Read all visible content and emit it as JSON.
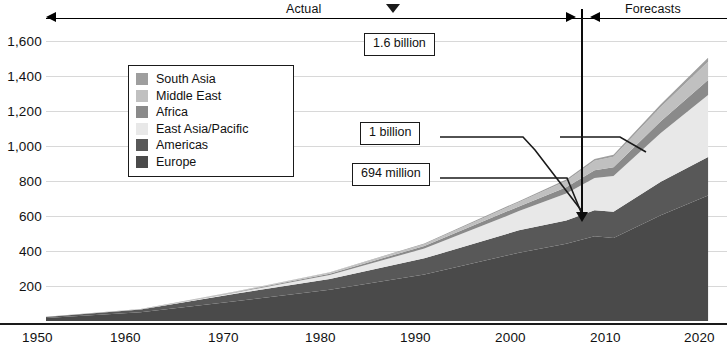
{
  "chart_data": {
    "type": "area",
    "title": "",
    "subtitle": "",
    "xlabel": "",
    "ylabel": "",
    "stacked": true,
    "grid": true,
    "legend_position": "inside-upper-left",
    "x": [
      1950,
      1960,
      1970,
      1980,
      1990,
      2000,
      2005,
      2008,
      2010,
      2015,
      2020
    ],
    "xlim": [
      1950,
      2022
    ],
    "ylim": [
      0,
      1700
    ],
    "xtick_labels": [
      "1950",
      "1960",
      "1970",
      "1980",
      "1990",
      "2000",
      "2010",
      "2020"
    ],
    "xticks": [
      1950,
      1960,
      1970,
      1980,
      1990,
      2000,
      2010,
      2020
    ],
    "ytick_labels": [
      "200",
      "400",
      "600",
      "800",
      "1,000",
      "1,200",
      "1,400",
      "1,600"
    ],
    "yticks": [
      200,
      400,
      600,
      800,
      1000,
      1200,
      1400,
      1600
    ],
    "series": [
      {
        "name": "Europe",
        "color": "#4a4a4a",
        "values": [
          17,
          50,
          113,
          178,
          265,
          390,
          441,
          485,
          475,
          605,
          717
        ]
      },
      {
        "name": "Americas",
        "color": "#585858",
        "values": [
          6,
          16,
          43,
          62,
          93,
          128,
          134,
          148,
          150,
          191,
          220
        ]
      },
      {
        "name": "East Asia/Pacific",
        "color": "#e8e8e8",
        "values": [
          0.2,
          1,
          6,
          23,
          56,
          110,
          154,
          184,
          204,
          279,
          355
        ]
      },
      {
        "name": "Africa",
        "color": "#8a8a8a",
        "values": [
          0.5,
          1,
          3,
          7,
          15,
          27,
          35,
          44,
          50,
          66,
          85
        ]
      },
      {
        "name": "Middle East",
        "color": "#c0c0c0",
        "values": [
          0.2,
          0.6,
          2,
          7,
          10,
          24,
          36,
          55,
          60,
          82,
          105
        ]
      },
      {
        "name": "South Asia",
        "color": "#9e9e9e",
        "values": [
          0.2,
          0.5,
          1,
          2,
          4,
          6,
          8,
          10,
          11,
          16,
          22
        ]
      }
    ],
    "annotations": [
      {
        "name": "callout-16-billion",
        "label": "1.6 billion",
        "target_year": 2020,
        "target_value": 1600
      },
      {
        "name": "callout-1-billion",
        "label": "1 billion",
        "target_year": 2012,
        "target_value": 1000
      },
      {
        "name": "callout-694-million",
        "label": "694 million",
        "target_year": 2008,
        "target_value": 694
      }
    ],
    "period_divider": {
      "year": 2008,
      "left_label": "Actual",
      "right_label": "Forecasts"
    }
  },
  "periods": {
    "actual_label": "Actual",
    "forecasts_label": "Forecasts"
  },
  "legend": {
    "items": [
      {
        "label": "South Asia",
        "color": "#9e9e9e"
      },
      {
        "label": "Middle East",
        "color": "#c0c0c0"
      },
      {
        "label": "Africa",
        "color": "#8a8a8a"
      },
      {
        "label": "East Asia/Pacific",
        "color": "#e8e8e8"
      },
      {
        "label": "Americas",
        "color": "#585858"
      },
      {
        "label": "Europe",
        "color": "#4a4a4a"
      }
    ]
  },
  "y_axis": {
    "labels": [
      "1,600",
      "1,400",
      "1,200",
      "1,000",
      "800",
      "600",
      "400",
      "200"
    ]
  },
  "x_axis": {
    "labels": [
      "1950",
      "1960",
      "1970",
      "1980",
      "1990",
      "2000",
      "2010",
      "2020"
    ]
  },
  "callouts": {
    "billion_16": "1.6 billion",
    "billion_1": "1 billion",
    "million_694": "694 million"
  },
  "colors": {
    "grid": "#d8d8d8",
    "axis": "#1a1a1a",
    "text": "#111111",
    "background": "#ffffff"
  }
}
